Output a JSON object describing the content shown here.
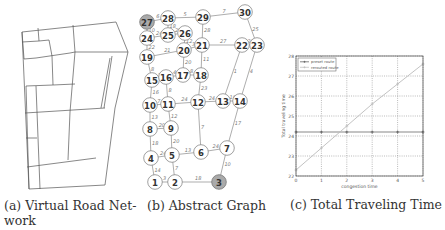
{
  "figures": [
    {
      "id": "a",
      "caption_line1": "(a) Virtual Road Net-",
      "caption_line2": "work"
    },
    {
      "id": "b",
      "caption": "(b) Abstract Graph"
    },
    {
      "id": "c",
      "caption": "(c) Total Traveling Time"
    }
  ],
  "graph": {
    "highlighted_nodes": [
      "27",
      "3"
    ],
    "nodes": [
      {
        "id": "1",
        "x": 155,
        "y": 182
      },
      {
        "id": "2",
        "x": 175,
        "y": 182
      },
      {
        "id": "3",
        "x": 219,
        "y": 182
      },
      {
        "id": "4",
        "x": 151,
        "y": 158
      },
      {
        "id": "5",
        "x": 172,
        "y": 155
      },
      {
        "id": "6",
        "x": 201,
        "y": 152
      },
      {
        "id": "7",
        "x": 227,
        "y": 148
      },
      {
        "id": "8",
        "x": 150,
        "y": 129
      },
      {
        "id": "9",
        "x": 171,
        "y": 128
      },
      {
        "id": "10",
        "x": 150,
        "y": 105
      },
      {
        "id": "11",
        "x": 168,
        "y": 104
      },
      {
        "id": "12",
        "x": 198,
        "y": 102
      },
      {
        "id": "13",
        "x": 223,
        "y": 101
      },
      {
        "id": "14",
        "x": 240,
        "y": 101
      },
      {
        "id": "15",
        "x": 152,
        "y": 80
      },
      {
        "id": "16",
        "x": 166,
        "y": 77
      },
      {
        "id": "17",
        "x": 183,
        "y": 75
      },
      {
        "id": "18",
        "x": 201,
        "y": 75
      },
      {
        "id": "19",
        "x": 147,
        "y": 57
      },
      {
        "id": "20",
        "x": 184,
        "y": 50
      },
      {
        "id": "21",
        "x": 202,
        "y": 45
      },
      {
        "id": "22",
        "x": 242,
        "y": 45
      },
      {
        "id": "23",
        "x": 257,
        "y": 45
      },
      {
        "id": "24",
        "x": 147,
        "y": 38
      },
      {
        "id": "25",
        "x": 168,
        "y": 35
      },
      {
        "id": "26",
        "x": 185,
        "y": 33
      },
      {
        "id": "27",
        "x": 147,
        "y": 22
      },
      {
        "id": "28",
        "x": 168,
        "y": 18
      },
      {
        "id": "29",
        "x": 203,
        "y": 17
      },
      {
        "id": "30",
        "x": 245,
        "y": 12
      }
    ],
    "edges": [
      {
        "a": "1",
        "b": "2",
        "w": "3"
      },
      {
        "a": "2",
        "b": "3",
        "w": "18"
      },
      {
        "a": "1",
        "b": "4",
        "w": "14"
      },
      {
        "a": "2",
        "b": "5",
        "w": "7"
      },
      {
        "a": "4",
        "b": "5",
        "w": "24"
      },
      {
        "a": "5",
        "b": "6",
        "w": "13"
      },
      {
        "a": "6",
        "b": "7",
        "w": "24"
      },
      {
        "a": "3",
        "b": "7",
        "w": "10"
      },
      {
        "a": "4",
        "b": "8",
        "w": "18"
      },
      {
        "a": "5",
        "b": "9",
        "w": "20"
      },
      {
        "a": "8",
        "b": "9",
        "w": "20"
      },
      {
        "a": "6",
        "b": "12",
        "w": "7"
      },
      {
        "a": "7",
        "b": "14",
        "w": "17"
      },
      {
        "a": "8",
        "b": "10",
        "w": "13"
      },
      {
        "a": "9",
        "b": "11",
        "w": "12"
      },
      {
        "a": "10",
        "b": "11",
        "w": "7"
      },
      {
        "a": "11",
        "b": "12",
        "w": "24"
      },
      {
        "a": "12",
        "b": "13",
        "w": "24"
      },
      {
        "a": "13",
        "b": "14",
        "w": "10"
      },
      {
        "a": "10",
        "b": "15",
        "w": "16"
      },
      {
        "a": "11",
        "b": "16",
        "w": "8"
      },
      {
        "a": "12",
        "b": "18",
        "w": "23"
      },
      {
        "a": "15",
        "b": "16",
        "w": "16"
      },
      {
        "a": "16",
        "b": "17",
        "w": "4"
      },
      {
        "a": "17",
        "b": "18",
        "w": "8"
      },
      {
        "a": "17",
        "b": "20",
        "w": "20"
      },
      {
        "a": "18",
        "b": "21",
        "w": "11"
      },
      {
        "a": "13",
        "b": "22",
        "w": "1"
      },
      {
        "a": "14",
        "b": "23",
        "w": "4"
      },
      {
        "a": "15",
        "b": "19",
        "w": "8"
      },
      {
        "a": "19",
        "b": "20",
        "w": "21"
      },
      {
        "a": "20",
        "b": "21",
        "w": "3"
      },
      {
        "a": "21",
        "b": "22",
        "w": "27"
      },
      {
        "a": "22",
        "b": "23",
        "w": "23"
      },
      {
        "a": "20",
        "b": "26",
        "w": "12"
      },
      {
        "a": "21",
        "b": "29",
        "w": "28"
      },
      {
        "a": "23",
        "b": "30",
        "w": "25"
      },
      {
        "a": "19",
        "b": "24",
        "w": "22"
      },
      {
        "a": "24",
        "b": "25",
        "w": "24"
      },
      {
        "a": "25",
        "b": "26",
        "w": "25"
      },
      {
        "a": "25",
        "b": "28",
        "w": "18"
      },
      {
        "a": "24",
        "b": "27",
        "w": "10"
      },
      {
        "a": "27",
        "b": "28",
        "w": "6"
      },
      {
        "a": "28",
        "b": "29",
        "w": "5"
      },
      {
        "a": "29",
        "b": "30",
        "w": "7"
      }
    ]
  },
  "chart_data": {
    "type": "line",
    "title": "",
    "xlabel": "congestion time",
    "ylabel": "Total traveling time",
    "x": [
      0,
      1,
      2,
      3,
      4,
      5
    ],
    "xlim": [
      0,
      5
    ],
    "ylim": [
      22,
      28
    ],
    "xticks": [
      "0",
      "1",
      "2",
      "3",
      "4",
      "5"
    ],
    "yticks": [
      "22",
      "23",
      "24",
      "25",
      "26",
      "27",
      "28"
    ],
    "grid": true,
    "legend_position": "upper left",
    "series": [
      {
        "name": "preset route",
        "values": [
          24.2,
          24.2,
          24.2,
          24.2,
          24.2,
          24.2
        ],
        "color": "#555555",
        "marker": "+"
      },
      {
        "name": "rerouted route",
        "values": [
          22.3,
          23.4,
          24.5,
          25.6,
          26.6,
          27.6
        ],
        "color": "#bbbbbb",
        "marker": "+"
      }
    ]
  }
}
